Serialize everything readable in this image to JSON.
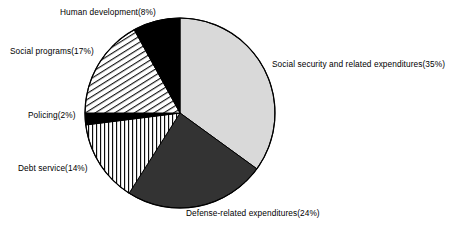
{
  "chart_data": {
    "type": "pie",
    "title": "",
    "xlabel": "",
    "ylabel": "",
    "legend_position": "none",
    "grid": false,
    "start_angle_deg": 0,
    "direction": "clockwise",
    "center": {
      "x": 180,
      "y": 113
    },
    "radius": 95,
    "categories": [
      "Social security and related expenditures",
      "Defense-related expenditures",
      "Debt service",
      "Policing",
      "Social programs",
      "Human development"
    ],
    "values": [
      35,
      24,
      14,
      2,
      17,
      8
    ],
    "unit": "%",
    "slices": [
      {
        "name": "Social security and related expenditures",
        "value": 35,
        "label": "Social security and related expenditures(35%)",
        "fill_style": "solid",
        "color": "#d9d9d9"
      },
      {
        "name": "Defense-related expenditures",
        "value": 24,
        "label": "Defense-related expenditures(24%)",
        "fill_style": "solid",
        "color": "#333333"
      },
      {
        "name": "Debt service",
        "value": 14,
        "label": "Debt service(14%)",
        "fill_style": "vertical-lines",
        "color": "#ffffff"
      },
      {
        "name": "Policing",
        "value": 2,
        "label": "Policing(2%)",
        "fill_style": "solid",
        "color": "#000000"
      },
      {
        "name": "Social programs",
        "value": 17,
        "label": "Social programs(17%)",
        "fill_style": "diagonal-lines",
        "color": "#ffffff"
      },
      {
        "name": "Human development",
        "value": 8,
        "label": "Human development(8%)",
        "fill_style": "solid",
        "color": "#000000"
      }
    ],
    "stroke_color": "#000000"
  },
  "labels": {
    "social_security": "Social security and related expenditures(35%)",
    "defense": "Defense-related expenditures(24%)",
    "debt_service": "Debt service(14%)",
    "policing": "Policing(2%)",
    "social_programs": "Social programs(17%)",
    "human_development": "Human development(8%)"
  }
}
